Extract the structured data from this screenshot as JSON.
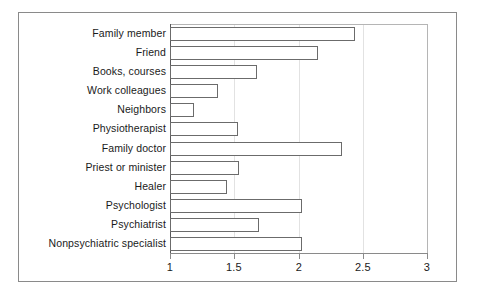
{
  "chart_data": {
    "type": "bar",
    "orientation": "horizontal",
    "title": "",
    "xlabel": "",
    "ylabel": "",
    "xlim": [
      1,
      3
    ],
    "xticks": [
      1,
      1.5,
      2,
      2.5,
      3
    ],
    "xticklabels": [
      "1",
      "1.5",
      "2",
      "2.5",
      "3"
    ],
    "grid": true,
    "legend": null,
    "categories": [
      "Family member",
      "Friend",
      "Books, courses",
      "Work colleagues",
      "Neighbors",
      "Physiotherapist",
      "Family doctor",
      "Priest or minister",
      "Healer",
      "Psychologist",
      "Psychiatrist",
      "Nonpsychiatric specialist"
    ],
    "values": [
      2.44,
      2.15,
      1.68,
      1.37,
      1.19,
      1.53,
      2.34,
      1.54,
      1.44,
      2.03,
      1.69,
      2.03
    ],
    "bar_facecolor": "#ffffff",
    "bar_edgecolor": "#6b6b6b",
    "frame_color": "#8a8a8a",
    "gridline_color": "#e2e2e2",
    "text_color": "#1a1a1a"
  }
}
